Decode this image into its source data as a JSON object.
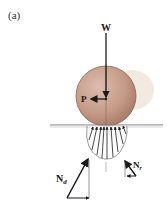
{
  "figure": {
    "caption_label": "(a)",
    "labels": {
      "weight": "W",
      "push_force": "P",
      "normal_d": "N",
      "normal_d_sub": "d",
      "normal_r": "N",
      "normal_r_sub": "r"
    },
    "colors": {
      "sphere": "#c49a86",
      "sphere_edge": "#8a6656",
      "ground": "#777777",
      "arrows": "#1a1a1a",
      "shadow": "#e9d8cc"
    }
  }
}
